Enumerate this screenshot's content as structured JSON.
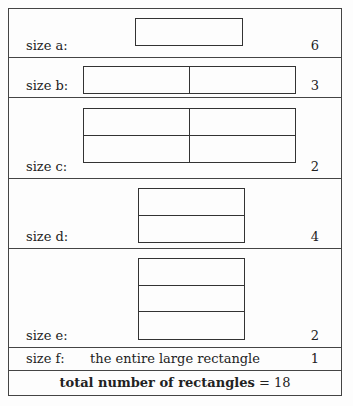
{
  "rows": [
    {
      "label": "size a:",
      "count": "6",
      "grid": {
        "cols": 1,
        "rows": 1
      }
    },
    {
      "label": "size b:",
      "count": "3",
      "grid": {
        "cols": 2,
        "rows": 1
      }
    },
    {
      "label": "size c:",
      "count": "2",
      "grid": {
        "cols": 2,
        "rows": 2
      }
    },
    {
      "label": "size d:",
      "count": "4",
      "grid": {
        "cols": 1,
        "rows": 2
      }
    },
    {
      "label": "size e:",
      "count": "2",
      "grid": {
        "cols": 1,
        "rows": 3
      }
    },
    {
      "label": "size f:",
      "count": "1",
      "description": "the entire large rectangle"
    }
  ],
  "total": {
    "label": "total number of rectangles",
    "operator": "=",
    "value": "18"
  }
}
